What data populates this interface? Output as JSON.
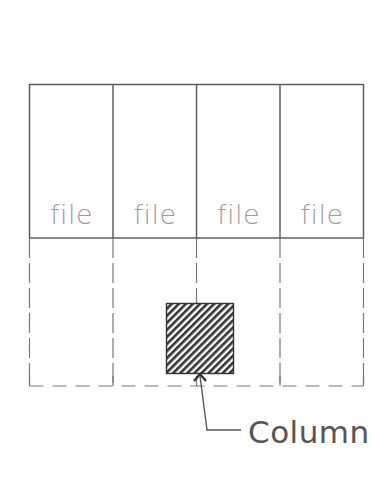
{
  "diagram": {
    "type": "floor-plan-section",
    "colors": {
      "line": "#555555",
      "dashed_line": "#777777",
      "file_label": "#9a9a9a",
      "hatch": "#333333",
      "callout": "#555555"
    },
    "upper_cells": [
      {
        "label": "file"
      },
      {
        "label": "file"
      },
      {
        "label": "file"
      },
      {
        "label": "file"
      }
    ],
    "lower_cells_style": "dashed",
    "column": {
      "fill": "diagonal-hatch",
      "callout_label": "Column"
    }
  }
}
